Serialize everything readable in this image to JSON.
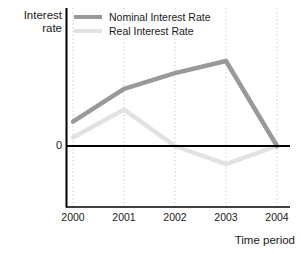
{
  "chart_data": {
    "type": "line",
    "title": "",
    "xlabel": "Time period",
    "ylabel": "Interest rate",
    "categories": [
      "2000",
      "2001",
      "2002",
      "2003",
      "2004"
    ],
    "series": [
      {
        "name": "Nominal Interest Rate",
        "color": "#999999",
        "values": [
          2.0,
          4.7,
          6.0,
          7.0,
          0.0
        ]
      },
      {
        "name": "Real Interest Rate",
        "color": "#e2e2e2",
        "values": [
          0.7,
          3.0,
          0.0,
          -1.5,
          0.0
        ]
      }
    ],
    "ylim": [
      -5.0,
      11.5
    ],
    "xlim": [
      0,
      4
    ],
    "yticks": [
      0
    ],
    "ytick_labels": [
      "0"
    ],
    "grid": "vertical-dotted",
    "zero_line": true,
    "legend_position": "top-left-inside"
  },
  "axes": {
    "y_title_line1": "Interest",
    "y_title_line2": "rate",
    "x_title": "Time period",
    "zero_tick_label": "0"
  },
  "legend": {
    "entries": [
      {
        "label": "Nominal Interest Rate",
        "color": "#999999"
      },
      {
        "label": "Real Interest Rate",
        "color": "#e2e2e2"
      }
    ]
  },
  "colors": {
    "nominal": "#999999",
    "real": "#e2e2e2",
    "axis": "#000000",
    "grid": "#cfcfcf",
    "text": "#1a1a1a",
    "background": "#ffffff"
  }
}
